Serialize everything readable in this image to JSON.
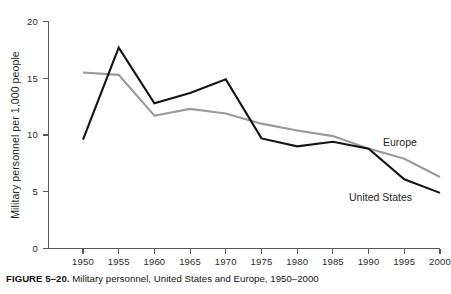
{
  "caption": {
    "label": "FIGURE 5–20.",
    "text": "Military personnel, United States and Europe, 1950–2000"
  },
  "axes": {
    "ylabel": "Military personnel per 1,000 people",
    "xlabel": "",
    "y_ticks": [
      "0",
      "5",
      "10",
      "15",
      "20"
    ],
    "x_ticks": [
      "1950",
      "1955",
      "1960",
      "1965",
      "1970",
      "1975",
      "1980",
      "1985",
      "1990",
      "1995",
      "2000"
    ]
  },
  "series_labels": {
    "europe": "Europe",
    "united_states": "United States"
  },
  "colors": {
    "united_states": "#141414",
    "europe": "#9a9a9a",
    "axis": "#555a5d",
    "background": "#ffffff"
  },
  "chart_data": {
    "type": "line",
    "title": "Military personnel, United States and Europe, 1950–2000",
    "xlabel": "",
    "ylabel": "Military personnel per 1,000 people",
    "x": [
      1950,
      1955,
      1960,
      1965,
      1970,
      1975,
      1980,
      1985,
      1990,
      1995,
      2000
    ],
    "categories": [
      "1950",
      "1955",
      "1960",
      "1965",
      "1970",
      "1975",
      "1980",
      "1985",
      "1990",
      "1995",
      "2000"
    ],
    "series": [
      {
        "name": "United States",
        "color": "#141414",
        "values": [
          9.6,
          17.7,
          12.8,
          13.7,
          14.9,
          9.7,
          9.0,
          9.4,
          8.8,
          6.1,
          4.9
        ]
      },
      {
        "name": "Europe",
        "color": "#9a9a9a",
        "values": [
          15.5,
          15.3,
          11.7,
          12.3,
          11.9,
          11.0,
          10.4,
          9.9,
          8.8,
          7.9,
          6.3
        ]
      }
    ],
    "xlim": [
      1950,
      2000
    ],
    "ylim": [
      0,
      20
    ],
    "grid": false,
    "legend": "inline-labels"
  }
}
